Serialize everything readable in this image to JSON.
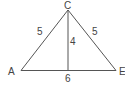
{
  "diagram": {
    "type": "triangle",
    "vertices": {
      "apex": {
        "label": "C"
      },
      "left": {
        "label": "A"
      },
      "right": {
        "label": "E"
      }
    },
    "side_labels": {
      "left_side": "5",
      "right_side": "5",
      "height": "4",
      "base": "6"
    },
    "colors": {
      "line": "#555555",
      "text": "#444444",
      "background": "#ffffff"
    }
  }
}
